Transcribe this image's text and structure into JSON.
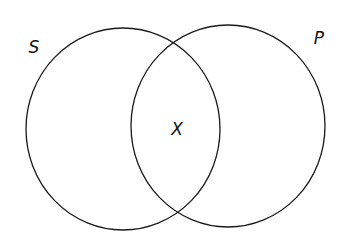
{
  "diagram": {
    "type": "venn",
    "stroke_color": "#1a1a1a",
    "background": "#ffffff",
    "sets": [
      {
        "id": "S",
        "label": "S",
        "cx": 123,
        "cy": 129,
        "rx": 97,
        "ry": 101,
        "label_x": 34,
        "label_y": 53
      },
      {
        "id": "P",
        "label": "P",
        "cx": 228,
        "cy": 126,
        "rx": 97,
        "ry": 101,
        "label_x": 319,
        "label_y": 44
      }
    ],
    "intersection": {
      "label": "X",
      "x": 177,
      "y": 135
    }
  }
}
